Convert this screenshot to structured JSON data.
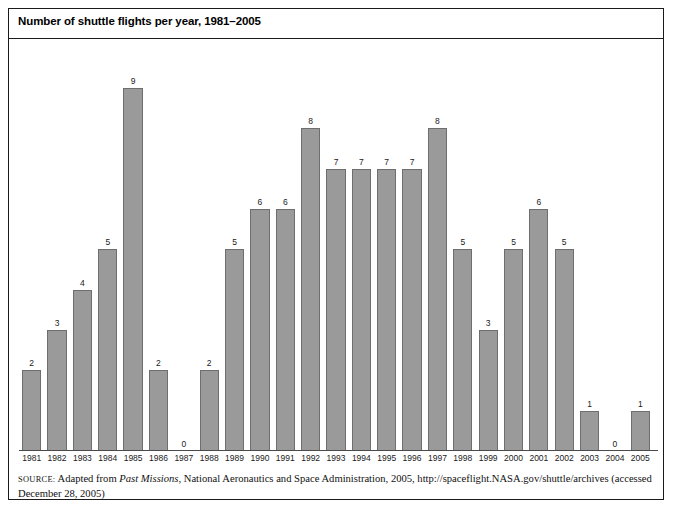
{
  "figure": {
    "title": "Number of shuttle flights per year, 1981–2005",
    "source_label": "Source:",
    "source_text_1": " Adapted from ",
    "source_italic": "Past Missions",
    "source_text_2": ", National Aeronautics and Space Administration, 2005, http://spaceflight.NASA.gov/shuttle/archives (accessed December 28, 2005)"
  },
  "colors": {
    "bar_fill": "#9a9a9a",
    "bar_stroke": "#6e6e6e",
    "frame": "#1a1a1a",
    "axis": "#4a4a4a",
    "text": "#000000"
  },
  "chart_data": {
    "type": "bar",
    "title": "Number of shuttle flights per year, 1981–2005",
    "xlabel": "",
    "ylabel": "",
    "ylim": [
      0,
      9
    ],
    "grid": false,
    "legend": "none",
    "data_labels": true,
    "categories": [
      "1981",
      "1982",
      "1983",
      "1984",
      "1985",
      "1986",
      "1987",
      "1988",
      "1989",
      "1990",
      "1991",
      "1992",
      "1993",
      "1994",
      "1995",
      "1996",
      "1997",
      "1998",
      "1999",
      "2000",
      "2001",
      "2002",
      "2003",
      "2004",
      "2005"
    ],
    "values": [
      2,
      3,
      4,
      5,
      9,
      2,
      0,
      2,
      5,
      6,
      6,
      8,
      7,
      7,
      7,
      7,
      8,
      5,
      3,
      5,
      6,
      5,
      1,
      0,
      1
    ]
  }
}
